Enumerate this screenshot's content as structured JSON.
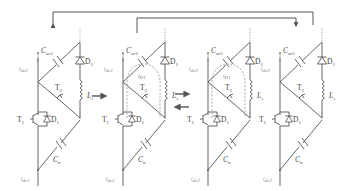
{
  "figure": {
    "type": "circuit-diagram",
    "stage_count": 4
  },
  "stages": [
    {
      "id": 1,
      "x": 0,
      "labels": {
        "cap_top": "C",
        "cap_top_sub": "ar1",
        "diode_top": "D",
        "diode_top_sub": "1",
        "switch_top": "T",
        "switch_top_sub": "2",
        "inductor": "L",
        "inductor_sub": "s",
        "switch_bottom": "T",
        "switch_bottom_sub": "1",
        "diode_bottom": "D",
        "diode_bottom_sub": "1",
        "cap_bottom": "C",
        "cap_bottom_sub": "n",
        "current_top": "i",
        "current_top_sub": "dc2",
        "current_bottom": "i",
        "current_bottom_sub": "dc1"
      },
      "loop_current": null
    },
    {
      "id": 2,
      "x": 85,
      "labels": {
        "cap_top": "C",
        "cap_top_sub": "ar1",
        "diode_top": "D",
        "diode_top_sub": "1",
        "switch_top": "T",
        "switch_top_sub": "2",
        "inductor": "L",
        "inductor_sub": "s",
        "switch_bottom": "T",
        "switch_bottom_sub": "1",
        "diode_bottom": "D",
        "diode_bottom_sub": "1",
        "cap_bottom": "C",
        "cap_bottom_sub": "n",
        "current_top": "i",
        "current_top_sub": "dc2",
        "current_bottom": "i",
        "current_bottom_sub": "dc2"
      },
      "loop_current": {
        "label": "i",
        "sub": "D1"
      }
    },
    {
      "id": 3,
      "x": 170,
      "labels": {
        "cap_top": "C",
        "cap_top_sub": "ar1",
        "diode_top": "D",
        "diode_top_sub": "1",
        "switch_top": "T",
        "switch_top_sub": "2",
        "inductor": "L",
        "inductor_sub": "s",
        "switch_bottom": "T",
        "switch_bottom_sub": "1",
        "diode_bottom": "D",
        "diode_bottom_sub": "1",
        "cap_bottom": "C",
        "cap_bottom_sub": "n",
        "current_top": "i",
        "current_top_sub": "dc2",
        "current_bottom": "i",
        "current_bottom_sub": "dc2"
      },
      "loop_current": {
        "label": "i",
        "sub": "D1"
      }
    },
    {
      "id": 4,
      "x": 255,
      "labels": {
        "cap_top": "C",
        "cap_top_sub": "ar1",
        "diode_top": "D",
        "diode_top_sub": "1",
        "switch_top": "T",
        "switch_top_sub": "2",
        "inductor": "L",
        "inductor_sub": "s",
        "switch_bottom": "T",
        "switch_bottom_sub": "1",
        "diode_bottom": "D",
        "diode_bottom_sub": "1",
        "cap_bottom": "C",
        "cap_bottom_sub": "n",
        "current_top": "i",
        "current_top_sub": "dc2",
        "current_bottom": "i",
        "current_bottom_sub": "dc2"
      },
      "loop_current": null
    }
  ],
  "transitions": [
    {
      "from": 1,
      "to": 2,
      "direction": "right"
    },
    {
      "from": 2,
      "to": 3,
      "direction": "right"
    },
    {
      "from": 3,
      "to": 2,
      "direction": "left"
    },
    {
      "from": 4,
      "to": 1,
      "path": "outer-top"
    },
    {
      "from": 2,
      "to": 4,
      "path": "inner-top"
    }
  ],
  "colors": {
    "wire": "#555555",
    "text": "#444444",
    "dashed": "#888888"
  }
}
